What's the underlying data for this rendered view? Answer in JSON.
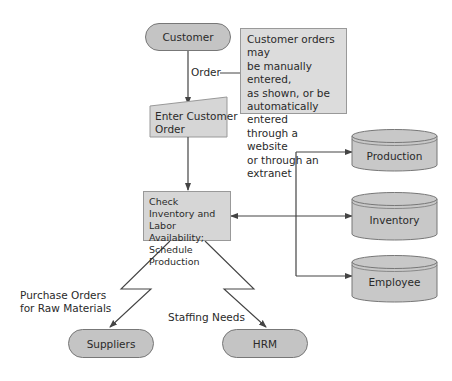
{
  "diagram": {
    "type": "order-entry-flowchart",
    "nodes": {
      "customer": {
        "label": "Customer",
        "shape": "terminator"
      },
      "enter_order": {
        "label_line1": "Enter Customer",
        "label_line2": "Order",
        "shape": "manual-input"
      },
      "check_inventory": {
        "label_line1": "Check Inventory and",
        "label_line2": "Labor Availability;",
        "label_line3": "Schedule Production",
        "shape": "process"
      },
      "suppliers": {
        "label": "Suppliers",
        "shape": "terminator"
      },
      "hrm": {
        "label": "HRM",
        "shape": "terminator"
      },
      "production": {
        "label": "Production",
        "shape": "database"
      },
      "inventory": {
        "label": "Inventory",
        "shape": "database"
      },
      "employee": {
        "label": "Employee",
        "shape": "database"
      }
    },
    "annotation": {
      "lines": [
        "Customer orders may",
        "be manually entered,",
        "as shown, or be",
        "automatically entered",
        "through a website",
        "or through an extranet"
      ]
    },
    "edges": {
      "order": {
        "label": "Order",
        "from": "Customer",
        "to": "Enter Customer Order"
      },
      "purchase_orders": {
        "label_line1": "Purchase Orders",
        "label_line2": "for Raw Materials",
        "from": "Check Inventory",
        "to": "Suppliers"
      },
      "staffing": {
        "label": "Staffing Needs",
        "from": "Check Inventory",
        "to": "HRM"
      }
    },
    "colors": {
      "fill": "#c4c4c4",
      "box_fill": "#d6d6d6",
      "line": "#444444"
    }
  }
}
